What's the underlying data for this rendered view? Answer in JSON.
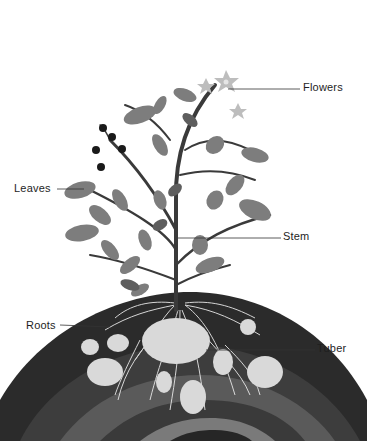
{
  "diagram": {
    "labels": [
      {
        "id": "flowers",
        "text": "Flowers",
        "x": 303,
        "y": 81
      },
      {
        "id": "leaves",
        "text": "Leaves",
        "x": 14,
        "y": 182
      },
      {
        "id": "stem",
        "text": "Stem",
        "x": 283,
        "y": 230
      },
      {
        "id": "roots",
        "text": "Roots",
        "x": 26,
        "y": 319
      },
      {
        "id": "tuber",
        "text": "Tuber",
        "x": 317,
        "y": 342
      }
    ],
    "colors": {
      "background": "#ffffff",
      "soil_outer": "#2b2b2b",
      "soil_band_1": "#3d3d3d",
      "soil_band_2": "#5a5a5a",
      "soil_band_3": "#7a7a7a",
      "soil_core": "#262626",
      "tuber": "#d9d9d9",
      "root": "#e8e8e8",
      "leaf": "#7d7d7d",
      "leaf_dark": "#5e5e5e",
      "stem": "#3a3a3a",
      "flower": "#bdbdbd",
      "berry": "#1a1a1a",
      "leader_line": "#333333",
      "label_text": "#1e1e1e"
    }
  }
}
